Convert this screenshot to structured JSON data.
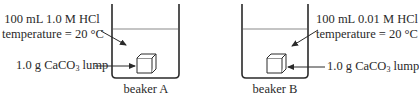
{
  "beakers": [
    {
      "name": "beaker A",
      "label": "beaker A",
      "solution_line1": "100 mL 1.0 M HCl",
      "solution_line2": "temperature = 20 °C",
      "solid_prefix": "1.0 g CaCO",
      "solid_sub": "3",
      "solid_suffix": " lump"
    },
    {
      "name": "beaker B",
      "label": "beaker B",
      "solution_line1": "100 mL 0.01 M HCl",
      "solution_line2": "temperature = 20 °C",
      "solid_prefix": "1.0 g CaCO",
      "solid_sub": "3",
      "solid_suffix": " lump"
    }
  ],
  "colors": {
    "stroke": "#2a2a2a",
    "liquid_line": "#8a8a8a",
    "background": "#ffffff"
  }
}
